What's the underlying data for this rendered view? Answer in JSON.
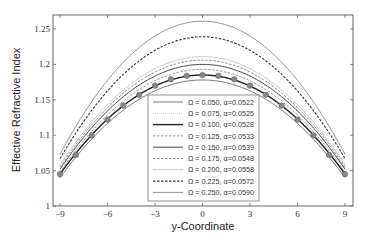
{
  "chart_data": {
    "type": "line",
    "title": "",
    "xlabel": "y-Coordinate",
    "ylabel": "Effective Refractive Index",
    "xlim": [
      -9.5,
      9.5
    ],
    "ylim": [
      1.0,
      1.27
    ],
    "xticks": [
      -9,
      -6,
      -3,
      0,
      3,
      6,
      9
    ],
    "xtick_labels": [
      "-9",
      "-6",
      "-3",
      "0",
      "3",
      "6",
      "9"
    ],
    "yticks": [
      1.0,
      1.05,
      1.1,
      1.15,
      1.2,
      1.25
    ],
    "ytick_labels": [
      "1",
      "1.05",
      "1.1",
      "1.15",
      "1.2",
      "1.25"
    ],
    "grid": false,
    "legend_position": "lower center (inside axes)",
    "x": [
      -9,
      -8,
      -7,
      -6,
      -5,
      -4,
      -3,
      -2,
      -1,
      0,
      1,
      2,
      3,
      4,
      5,
      6,
      7,
      8,
      9
    ],
    "series": [
      {
        "name": "Ω = 0.050, α=0.0522",
        "style": "solid",
        "color": "#555555",
        "width": 0.8,
        "peak": 1.178,
        "edge": 1.04
      },
      {
        "name": "Ω = 0.075, α=0.0525",
        "style": "dotted",
        "color": "#bbbbbb",
        "width": 0.8,
        "peak": 1.185,
        "edge": 1.045
      },
      {
        "name": "Ω = 0.100, α=0.0528",
        "style": "solid",
        "color": "#222222",
        "width": 1.4,
        "peak": 1.185,
        "edge": 1.045
      },
      {
        "name": "Ω = 0.125, α=0.0533",
        "style": "dashed",
        "color": "#777777",
        "width": 0.8,
        "peak": 1.193,
        "edge": 1.048
      },
      {
        "name": "Ω = 0.150, α=0.0539",
        "style": "solid",
        "color": "#444444",
        "width": 1.0,
        "peak": 1.2,
        "edge": 1.052
      },
      {
        "name": "Ω = 0.175, α=0.0548",
        "style": "dashed",
        "color": "#666666",
        "width": 0.8,
        "peak": 1.206,
        "edge": 1.055
      },
      {
        "name": "Ω = 0.200, α=0.0558",
        "style": "solid",
        "color": "#bbbbbb",
        "width": 0.8,
        "peak": 1.211,
        "edge": 1.058
      },
      {
        "name": "Ω = 0.225, α=0.0572",
        "style": "dashed",
        "color": "#333333",
        "width": 1.1,
        "peak": 1.239,
        "edge": 1.067
      },
      {
        "name": "Ω = 0.250, α=0.0590",
        "style": "solid",
        "color": "#777777",
        "width": 0.8,
        "peak": 1.261,
        "edge": 1.073
      }
    ],
    "markers": {
      "name": "reference (circle markers)",
      "color": "#888888",
      "x": [
        -9,
        -8,
        -7,
        -6,
        -5,
        -4,
        -3,
        -2,
        -1,
        0,
        1,
        2,
        3,
        4,
        5,
        6,
        7,
        8,
        9
      ],
      "values": [
        1.045,
        1.072,
        1.1,
        1.122,
        1.142,
        1.157,
        1.17,
        1.179,
        1.184,
        1.185,
        1.184,
        1.179,
        1.17,
        1.157,
        1.142,
        1.122,
        1.1,
        1.072,
        1.045
      ]
    }
  }
}
